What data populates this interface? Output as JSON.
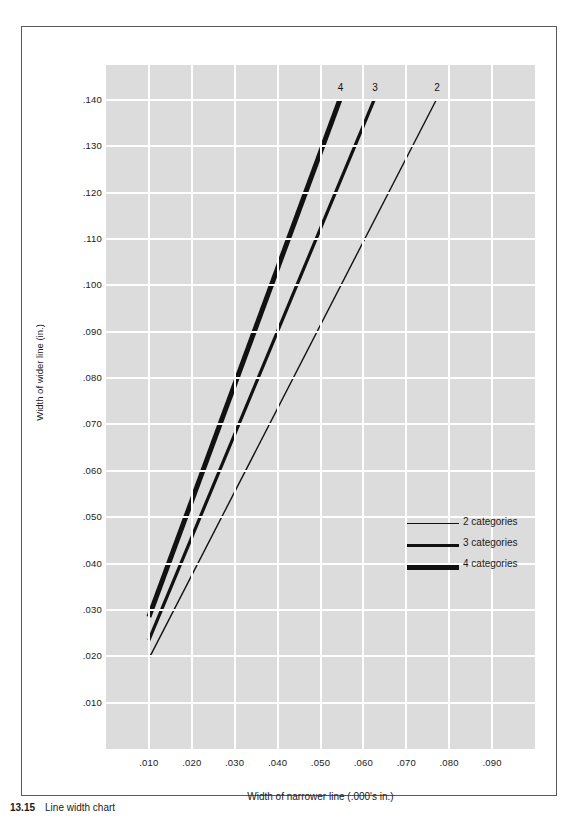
{
  "figure": {
    "caption_number": "13.15",
    "caption_text": "Line width chart"
  },
  "chart_data": {
    "type": "line",
    "title": "",
    "xlabel": "Width of narrower line (.000's in.)",
    "ylabel": "Width of wider line (in.)",
    "xlim": [
      0.0,
      0.1
    ],
    "ylim": [
      0.0,
      0.1475
    ],
    "xticks": [
      ".010",
      ".020",
      ".030",
      ".040",
      ".050",
      ".060",
      ".070",
      ".080",
      ".090"
    ],
    "xtick_values": [
      0.01,
      0.02,
      0.03,
      0.04,
      0.05,
      0.06,
      0.07,
      0.08,
      0.09
    ],
    "yticks": [
      ".140",
      ".130",
      ".120",
      ".110",
      ".100",
      ".090",
      ".080",
      ".070",
      ".060",
      ".050",
      ".040",
      ".030",
      ".020",
      ".010"
    ],
    "ytick_values": [
      0.14,
      0.13,
      0.12,
      0.11,
      0.1,
      0.09,
      0.08,
      0.07,
      0.06,
      0.05,
      0.04,
      0.03,
      0.02,
      0.01
    ],
    "grid": true,
    "grid_color": "#ffffff",
    "plot_background": "#dcdcdc",
    "legend_position": "center-right",
    "series": [
      {
        "name": "2 categories",
        "end_label": "2",
        "line_width_px": 1.4,
        "color": "#111111",
        "x": [
          0.01,
          0.077
        ],
        "y": [
          0.0195,
          0.14
        ]
      },
      {
        "name": "3 categories",
        "end_label": "3",
        "line_width_px": 3.2,
        "color": "#111111",
        "x": [
          0.01,
          0.0625
        ],
        "y": [
          0.0235,
          0.14
        ]
      },
      {
        "name": "4 categories",
        "end_label": "4",
        "line_width_px": 5.0,
        "color": "#111111",
        "x": [
          0.01,
          0.0545
        ],
        "y": [
          0.0285,
          0.14
        ]
      }
    ],
    "legend": [
      {
        "label": "2 categories",
        "thickness_px": 1.4
      },
      {
        "label": "3 categories",
        "thickness_px": 3.2
      },
      {
        "label": "4 categories",
        "thickness_px": 5.0
      }
    ]
  }
}
